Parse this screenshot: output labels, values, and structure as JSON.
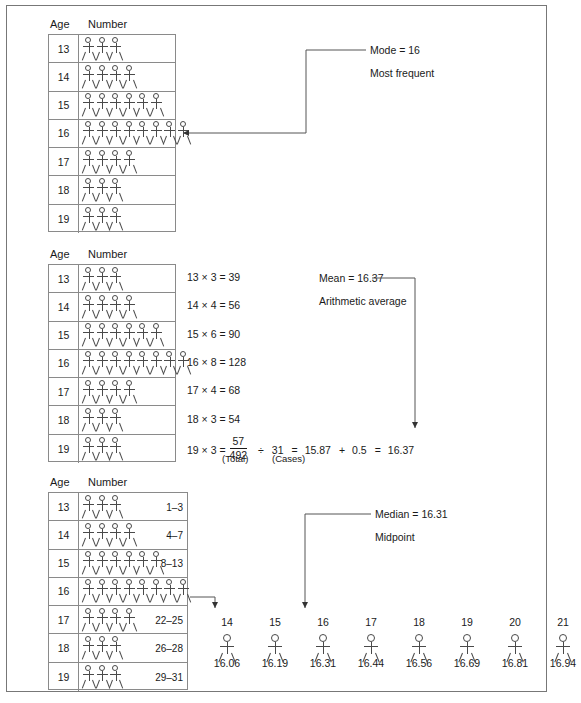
{
  "headers": {
    "age": "Age",
    "number": "Number"
  },
  "table_mode": {
    "rows": [
      {
        "age": "13",
        "count": 3
      },
      {
        "age": "14",
        "count": 4
      },
      {
        "age": "15",
        "count": 6
      },
      {
        "age": "16",
        "count": 8
      },
      {
        "age": "17",
        "count": 4
      },
      {
        "age": "18",
        "count": 3
      },
      {
        "age": "19",
        "count": 3
      }
    ]
  },
  "table_mean": {
    "rows": [
      {
        "age": "13",
        "count": 3,
        "equation": "13 × 3 = 39"
      },
      {
        "age": "14",
        "count": 4,
        "equation": "14 × 4 = 56"
      },
      {
        "age": "15",
        "count": 6,
        "equation": "15 × 6 = 90"
      },
      {
        "age": "16",
        "count": 8,
        "equation": "16 × 8 = 128"
      },
      {
        "age": "17",
        "count": 4,
        "equation": "17 × 4 = 68"
      },
      {
        "age": "18",
        "count": 3,
        "equation": "18 × 3 = 54"
      },
      {
        "age": "19",
        "count": 3,
        "equation": "19 × 3 ="
      }
    ],
    "final": {
      "numerator": "57",
      "denominator": "492",
      "total_label": "(Total)",
      "cases_label": "(Cases)",
      "divide_sign": "÷",
      "cases": "31",
      "equals1": "=",
      "quotient": "15.87",
      "plus": "+",
      "addend": "0.5",
      "equals2": "=",
      "result": "16.37"
    }
  },
  "table_median": {
    "rows": [
      {
        "age": "13",
        "count": 3,
        "range": "1–3"
      },
      {
        "age": "14",
        "count": 4,
        "range": "4–7"
      },
      {
        "age": "15",
        "count": 6,
        "range": "8–13"
      },
      {
        "age": "16",
        "count": 8,
        "range": ""
      },
      {
        "age": "17",
        "count": 4,
        "range": "22–25"
      },
      {
        "age": "18",
        "count": 3,
        "range": "26–28"
      },
      {
        "age": "19",
        "count": 3,
        "range": "29–31"
      }
    ]
  },
  "callouts": {
    "mode": {
      "title": "Mode  =  16",
      "subtitle": "Most frequent"
    },
    "mean": {
      "title": "Mean  =  16.37",
      "subtitle": "Arithmetic average"
    },
    "median": {
      "title": "Median  =  16.31",
      "subtitle": "Midpoint"
    }
  },
  "number_line": {
    "positions": [
      "14",
      "15",
      "16",
      "17",
      "18",
      "19",
      "20",
      "21"
    ],
    "values": [
      "16.06",
      "16.19",
      "16.31",
      "16.44",
      "16.56",
      "16.69",
      "16.81",
      "16.94"
    ]
  },
  "colors": {
    "ink": "#1a1a1a",
    "rule": "#8a8a8a",
    "figure": "#4a4a4a",
    "border": "#777777"
  }
}
